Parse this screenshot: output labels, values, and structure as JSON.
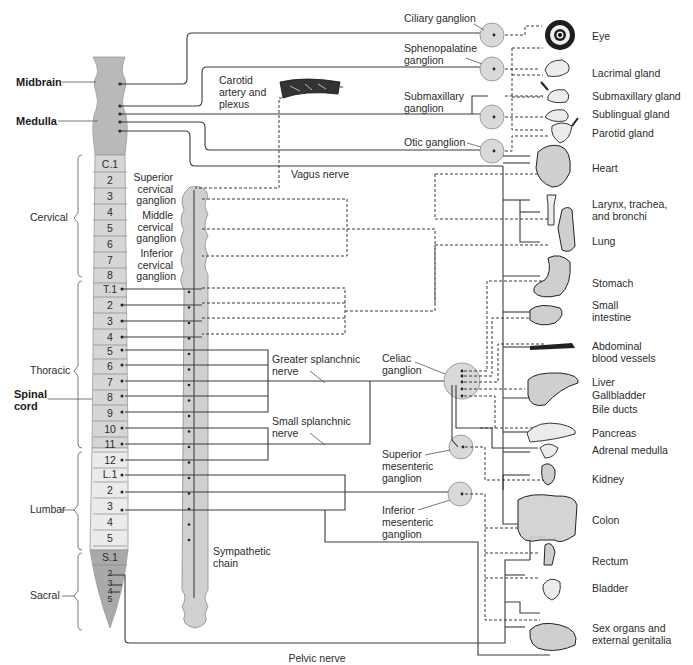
{
  "brain_labels": {
    "midbrain": "Midbrain",
    "medulla": "Medulla",
    "spinal_cord": [
      "Spinal",
      "cord"
    ]
  },
  "regions": [
    {
      "name": "Cervical",
      "segments": [
        "C.1",
        "2",
        "3",
        "4",
        "5",
        "6",
        "7",
        "8"
      ]
    },
    {
      "name": "Thoracic",
      "segments": [
        "T.1",
        "2",
        "3",
        "4",
        "5",
        "6",
        "7",
        "8",
        "9",
        "10",
        "11",
        "12"
      ]
    },
    {
      "name": "Lumbar",
      "segments": [
        "L.1",
        "2",
        "3",
        "4",
        "5"
      ]
    },
    {
      "name": "Sacral",
      "segments": [
        "S.1",
        "2",
        "3",
        "4",
        "5"
      ]
    }
  ],
  "sympathetic": {
    "superior_cervical": [
      "Superior",
      "cervical",
      "ganglion"
    ],
    "middle_cervical": [
      "Middle",
      "cervical",
      "ganglion"
    ],
    "inferior_cervical": [
      "Inferior",
      "cervical",
      "ganglion"
    ],
    "chain": [
      "Sympathetic",
      "chain"
    ],
    "greater_splanchnic": [
      "Greater splanchnic",
      "nerve"
    ],
    "small_splanchnic": [
      "Small splanchnic",
      "nerve"
    ],
    "celiac": [
      "Celiac",
      "ganglion"
    ],
    "superior_mesenteric": [
      "Superior",
      "mesenteric",
      "ganglion"
    ],
    "inferior_mesenteric": [
      "Inferior",
      "mesenteric",
      "ganglion"
    ]
  },
  "parasympathetic": {
    "ciliary": "Ciliary ganglion",
    "sphenopalatine": [
      "Sphenopalatine",
      "ganglion"
    ],
    "submaxillary": [
      "Submaxillary",
      "ganglion"
    ],
    "otic": "Otic ganglion",
    "carotid": [
      "Carotid",
      "artery and",
      "plexus"
    ],
    "vagus": "Vagus nerve",
    "pelvic": "Pelvic nerve"
  },
  "organs": [
    {
      "id": "eye",
      "lines": [
        "Eye"
      ]
    },
    {
      "id": "lacrimal",
      "lines": [
        "Lacrimal gland"
      ]
    },
    {
      "id": "submaxillary",
      "lines": [
        "Submaxillary gland"
      ]
    },
    {
      "id": "sublingual",
      "lines": [
        "Sublingual gland"
      ]
    },
    {
      "id": "parotid",
      "lines": [
        "Parotid gland"
      ]
    },
    {
      "id": "heart",
      "lines": [
        "Heart"
      ]
    },
    {
      "id": "larynx",
      "lines": [
        "Larynx, trachea,",
        "and bronchi"
      ]
    },
    {
      "id": "lung",
      "lines": [
        "Lung"
      ]
    },
    {
      "id": "stomach",
      "lines": [
        "Stomach"
      ]
    },
    {
      "id": "small_intestine",
      "lines": [
        "Small",
        "intestine"
      ]
    },
    {
      "id": "abdominal_vessels",
      "lines": [
        "Abdominal",
        "blood vessels"
      ]
    },
    {
      "id": "liver",
      "lines": [
        "Liver"
      ]
    },
    {
      "id": "gallbladder",
      "lines": [
        "Gallbladder"
      ]
    },
    {
      "id": "bile_ducts",
      "lines": [
        "Bile ducts"
      ]
    },
    {
      "id": "pancreas",
      "lines": [
        "Pancreas"
      ]
    },
    {
      "id": "adrenal",
      "lines": [
        "Adrenal medulla"
      ]
    },
    {
      "id": "kidney",
      "lines": [
        "Kidney"
      ]
    },
    {
      "id": "colon",
      "lines": [
        "Colon"
      ]
    },
    {
      "id": "rectum",
      "lines": [
        "Rectum"
      ]
    },
    {
      "id": "bladder",
      "lines": [
        "Bladder"
      ]
    },
    {
      "id": "sex_organs",
      "lines": [
        "Sex organs and",
        "external genitalia"
      ]
    }
  ],
  "colors": {
    "cord_brain": "#b9b9b9",
    "cord_cervical_thoracic": "#d6d6d6",
    "cord_lumbar": "#ebebeb",
    "cord_sacral": "#a9a9a9",
    "ganglion": "#d9d9d9",
    "line": "#3a3a3a"
  }
}
